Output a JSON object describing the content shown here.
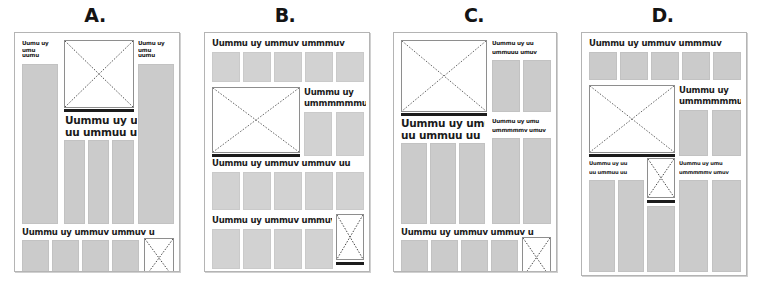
{
  "figure": {
    "type": "layout-wireframe-comparison",
    "page_count": 4,
    "colors": {
      "page_background": "#ffffff",
      "page_border": "#b4b4b4",
      "text_block_gray": "#cbcbcb",
      "headline_text": "#1a1a1a",
      "image_border": "#8e8e8e",
      "caption_rule": "#1c1c1c",
      "label_text": "#141414"
    },
    "greek": {
      "headline_long": "Uummu uy ummuv ummmuv",
      "headline_long_alt": "Uummu uy ummuv ummuv uu",
      "headline_long_alt2": "Uummu uy ummuv ummuv u",
      "headline_wide": "Uummu uy ummuv ummuv u",
      "headline_two_line_1": "Uummu uy umu",
      "headline_two_line_2": "uu ummuu uu",
      "sub_two_line_1": "Uummu uy",
      "sub_two_line_2": "ummmmmmu",
      "small_1": "Uummu uy uu",
      "small_2": "ummuuu umuv",
      "small_3": "Uummu uy umu",
      "small_4": "ummmmmv umuv",
      "col_head_1": "Uumu uy umu",
      "col_head_2": "ummu uumu",
      "col_head_3": "uumu"
    }
  },
  "panels": [
    {
      "id": "a",
      "label": "A.",
      "name": "layout-a",
      "headlines": [
        "Uummu uy umu uu ummuu uu",
        "Uummu uy ummuv ummuv u"
      ],
      "image_count": 2,
      "text_block_count": 9
    },
    {
      "id": "b",
      "label": "B.",
      "name": "layout-b",
      "headlines": [
        "Uummu uy ummuv ummmuv",
        "Uummu uy ummmmmmu",
        "Uummu uy ummuv ummuv uu",
        "Uummu uy ummuv ummuv u"
      ],
      "image_count": 2,
      "text_block_count": 16
    },
    {
      "id": "c",
      "label": "C.",
      "name": "layout-c",
      "headlines": [
        "Uummu uy uu ummuuu umuv",
        "Uummu uy umu ummmmmv umuv",
        "Uummu uy umu uu ummuu uu",
        "Uummu uy ummuv ummuv u"
      ],
      "image_count": 2,
      "text_block_count": 11
    },
    {
      "id": "d",
      "label": "D.",
      "name": "layout-d",
      "headlines": [
        "Uummu uy ummuv ummmuv",
        "Uummu uy ummmmmmu",
        "Uummu uy umu uu ummuu uu",
        "Uummu uy umu ummmmmvmuv"
      ],
      "image_count": 3,
      "text_block_count": 14
    }
  ]
}
